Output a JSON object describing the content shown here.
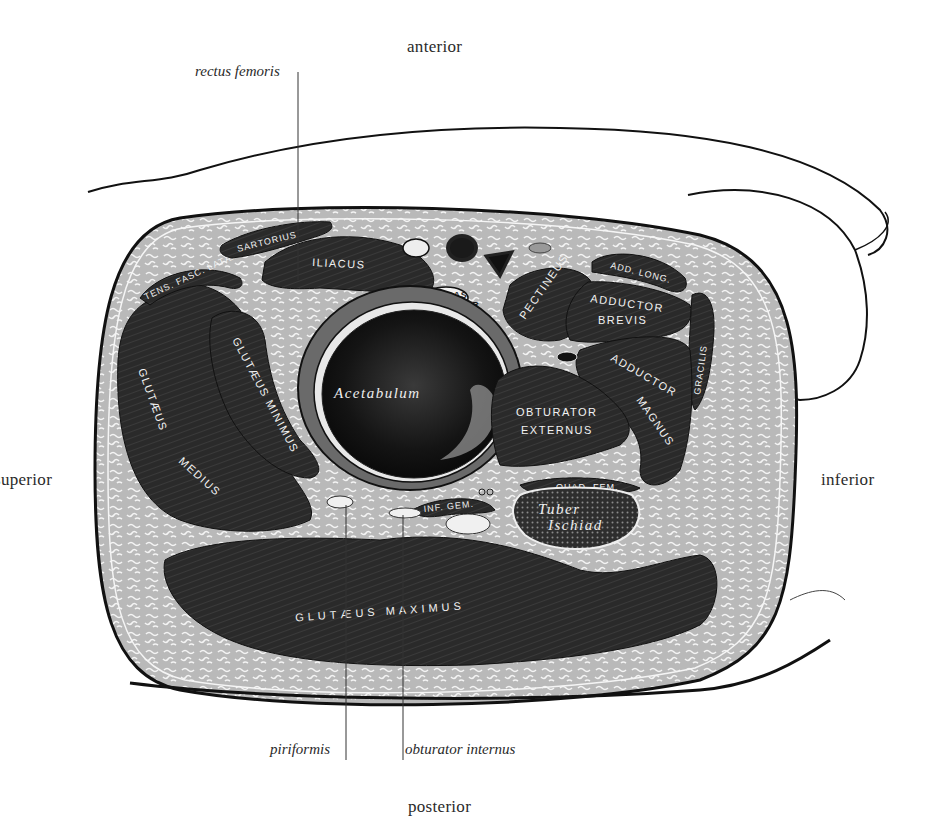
{
  "figure": {
    "colors": {
      "background": "#ffffff",
      "muscle": "#2b2b2b",
      "fat": "#bdbdbd",
      "outline": "#111111",
      "text": "#2a2a2a"
    }
  },
  "orientation": {
    "top": "anterior",
    "bottom": "posterior",
    "left": "superior",
    "right": "inferior"
  },
  "callouts": {
    "rectus_femoris": "rectus femoris",
    "piriformis": "piriformis",
    "obturator_internus": "obturator internus"
  },
  "structures": {
    "sartorius": "SARTORIUS",
    "iliacus": "ILIACUS",
    "tens_fasc_latae": "TENS. FASC. LATÆ",
    "psoas_major_1": "PSOAS",
    "psoas_major_2": "MAJOR",
    "pectineus": "PECTINEUS",
    "add_long": "ADD. LONG.",
    "adductor_brevis_1": "ADDUCTOR",
    "adductor_brevis_2": "BREVIS",
    "gracilis": "GRACILIS",
    "adductor_magnus_1": "ADDUCTOR",
    "adductor_magnus_2": "MAGNUS",
    "gluteus_minimus": "GLUTÆUS MINIMUS",
    "gluteus_medius_1": "GLUTÆUS",
    "gluteus_medius_2": "MEDIUS",
    "acetabulum": "Acetabulum",
    "obturator_externus_1": "OBTURATOR",
    "obturator_externus_2": "EXTERNUS",
    "quad_fem": "QUAD. FEM.",
    "tuber_ischiad_1": "Tuber",
    "tuber_ischiad_2": "Ischiad",
    "inf_gem": "INF. GEM.",
    "gluteus_maximus": "GLUTÆUS MAXIMUS"
  }
}
